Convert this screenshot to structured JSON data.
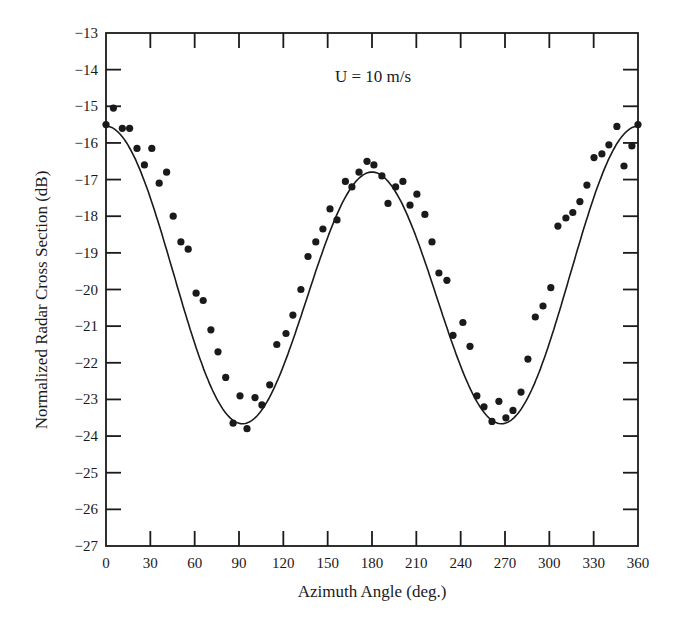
{
  "chart_data": {
    "type": "scatter",
    "title": "",
    "annotation": "U = 10 m/s",
    "xlabel": "Azimuth Angle (deg.)",
    "ylabel": "Normalized Radar Cross Section (dB)",
    "xlim": [
      0,
      360
    ],
    "ylim": [
      -27,
      -13
    ],
    "xticks": [
      0,
      30,
      60,
      90,
      120,
      150,
      180,
      210,
      240,
      270,
      300,
      330,
      360
    ],
    "yticks": [
      -13,
      -14,
      -15,
      -16,
      -17,
      -18,
      -19,
      -20,
      -21,
      -22,
      -23,
      -24,
      -25,
      -26,
      -27
    ],
    "grid": false,
    "legend": null,
    "series": [
      {
        "name": "measured",
        "style": "markers",
        "x": [
          0,
          5,
          11,
          16,
          21,
          26,
          31,
          36,
          41,
          45.5,
          50.7,
          55.6,
          61,
          65.8,
          71,
          75.8,
          81,
          86,
          90.7,
          95.4,
          100.8,
          105.5,
          110.8,
          115.6,
          121.8,
          126.5,
          131.9,
          136.7,
          142,
          146.8,
          151.6,
          156.3,
          162,
          166.4,
          171.2,
          176.6,
          181.3,
          186.7,
          190.8,
          196,
          200.9,
          205.7,
          210.4,
          215.8,
          220.6,
          225.3,
          230.7,
          234.8,
          241.5,
          246.3,
          251,
          255.8,
          261.2,
          265.9,
          270.6,
          275.4,
          280.8,
          285.5,
          290.5,
          295.7,
          301,
          305.8,
          311.2,
          315.9,
          320.7,
          325.4,
          330.2,
          335.6,
          340.3,
          345.7,
          350.5,
          355.9,
          360
        ],
        "y": [
          -15.5,
          -15.05,
          -15.6,
          -15.6,
          -16.15,
          -16.6,
          -16.15,
          -17.1,
          -16.8,
          -18.0,
          -18.7,
          -18.9,
          -20.1,
          -20.3,
          -21.1,
          -21.7,
          -22.4,
          -23.65,
          -22.9,
          -23.8,
          -22.95,
          -23.15,
          -22.6,
          -21.5,
          -21.2,
          -20.7,
          -20.0,
          -19.1,
          -18.7,
          -18.35,
          -17.8,
          -18.1,
          -17.05,
          -17.2,
          -16.8,
          -16.5,
          -16.6,
          -16.9,
          -17.65,
          -17.2,
          -17.05,
          -17.7,
          -17.4,
          -17.95,
          -18.7,
          -19.55,
          -19.75,
          -21.25,
          -20.9,
          -21.55,
          -22.9,
          -23.2,
          -23.6,
          -23.05,
          -23.5,
          -23.3,
          -22.8,
          -21.9,
          -20.75,
          -20.45,
          -19.95,
          -18.27,
          -18.05,
          -17.9,
          -17.6,
          -17.15,
          -16.4,
          -16.3,
          -16.05,
          -15.55,
          -16.63,
          -16.08,
          -15.5
        ]
      },
      {
        "name": "fit",
        "style": "line",
        "model": "A + B*cos(2*phi) + C*cos(phi)",
        "params": {
          "A": -19.91,
          "B": 3.74,
          "C": 0.625
        }
      }
    ]
  },
  "colors": {
    "ink": "#1a1a1a",
    "background": "#ffffff"
  }
}
